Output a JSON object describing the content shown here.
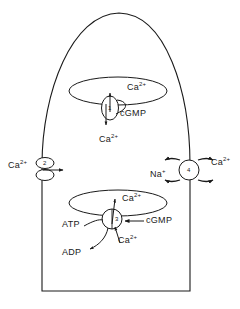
{
  "figure": {
    "stroke_color": "#1a1a1a",
    "background": "#ffffff"
  },
  "cell": {
    "name": "outer-segment-cell-outline",
    "shape": "dome-topped rectangle"
  },
  "compartments": [
    {
      "name": "upper-disc",
      "label": "Ca",
      "charge": "2+"
    },
    {
      "name": "lower-disc",
      "label": "Ca",
      "charge": "2+"
    }
  ],
  "elements": [
    {
      "id": "1",
      "name": "disc-cgmp-gated-channel",
      "position": "upper disc membrane",
      "ligand": "cGMP",
      "ion_in": "Ca",
      "ion_in_charge": "2+",
      "ion_out": "Ca",
      "ion_out_charge": "2+"
    },
    {
      "id": "2",
      "name": "plasma-membrane-calcium-channel",
      "position": "left plasma membrane",
      "ion": "Ca",
      "ion_charge": "2+"
    },
    {
      "id": "3",
      "name": "disc-calcium-atpase-pump",
      "position": "lower disc membrane",
      "substrate": "ATP",
      "product": "ADP",
      "ligand": "cGMP",
      "ion": "Ca",
      "ion_charge": "2+"
    },
    {
      "id": "4",
      "name": "sodium-calcium-exchanger",
      "position": "right plasma membrane",
      "ion_in": "Na",
      "ion_in_charge": "+",
      "ion_out": "Ca",
      "ion_out_charge": "2+"
    }
  ],
  "labels": {
    "upper_disc_ca": {
      "text": "Ca",
      "sup": "2+"
    },
    "upper_cgmp": {
      "text": "cGMP"
    },
    "upper_cyto_ca": {
      "text": "Ca",
      "sup": "2+"
    },
    "left_ca": {
      "text": "Ca",
      "sup": "2+"
    },
    "right_na": {
      "text": "Na",
      "sup": "+"
    },
    "right_ca": {
      "text": "Ca",
      "sup": "2+"
    },
    "lower_disc_ca": {
      "text": "Ca",
      "sup": "2+"
    },
    "lower_atp": {
      "text": "ATP"
    },
    "lower_adp": {
      "text": "ADP"
    },
    "lower_cgmp": {
      "text": "cGMP"
    },
    "lower_cyto_ca": {
      "text": "Ca",
      "sup": "2+"
    },
    "num_1": "1",
    "num_2": "2",
    "num_3": "3",
    "num_4": "4"
  }
}
